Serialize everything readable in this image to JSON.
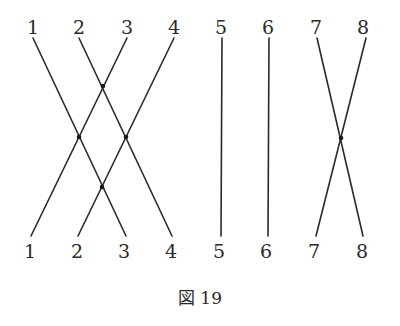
{
  "figure": {
    "caption": "図 19",
    "top_labels": [
      "1",
      "2",
      "3",
      "4",
      "5",
      "6",
      "7",
      "8"
    ],
    "bottom_labels": [
      "1",
      "2",
      "3",
      "4",
      "5",
      "6",
      "7",
      "8"
    ],
    "label_x": [
      33,
      79,
      127,
      174,
      221,
      268,
      316,
      363
    ],
    "strands": [
      {
        "from_top": "1",
        "to_bottom": "3"
      },
      {
        "from_top": "2",
        "to_bottom": "4"
      },
      {
        "from_top": "3",
        "to_bottom": "1"
      },
      {
        "from_top": "4",
        "to_bottom": "2"
      },
      {
        "from_top": "5",
        "to_bottom": "5"
      },
      {
        "from_top": "6",
        "to_bottom": "6"
      },
      {
        "from_top": "7",
        "to_bottom": "8"
      },
      {
        "from_top": "8",
        "to_bottom": "7"
      }
    ],
    "crossing_count": 5,
    "line_color": "#2a2a2a"
  }
}
